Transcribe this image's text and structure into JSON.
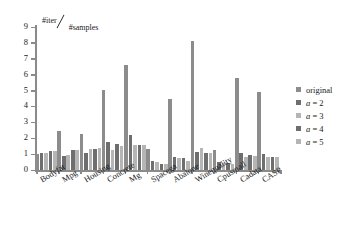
{
  "chart_data": {
    "type": "bar",
    "title_numerator": "#iter",
    "title_denominator": "#samples",
    "xlabel": "",
    "ylabel": "",
    "ylim": [
      0,
      9
    ],
    "yticks": [
      0,
      1,
      2,
      3,
      4,
      5,
      6,
      7,
      8,
      9
    ],
    "ytick_labels": [
      "0",
      "1",
      "2",
      "3",
      "4",
      "5",
      "6",
      "7",
      "8",
      "9"
    ],
    "grid": false,
    "legend_position": "right",
    "categories": [
      "Bodyfat",
      "Mpg",
      "Housing",
      "Concrete",
      "Mg",
      "Spacega",
      "Abalone",
      "Winequality",
      "Cpusmall",
      "Cadata",
      "CASP"
    ],
    "series": [
      {
        "name": "original",
        "color": "#8c8c8c",
        "values": [
          1.0,
          2.45,
          2.25,
          5.05,
          6.6,
          1.3,
          4.5,
          8.1,
          1.25,
          5.8,
          4.9
        ]
      },
      {
        "name": "a = 2",
        "color": "#6e6e6e",
        "values": [
          1.05,
          0.9,
          1.1,
          1.75,
          2.2,
          0.55,
          0.8,
          1.15,
          0.5,
          1.1,
          1.0
        ]
      },
      {
        "name": "a = 3",
        "color": "#b5b5b5",
        "values": [
          1.1,
          0.95,
          1.3,
          1.25,
          1.6,
          0.5,
          0.75,
          1.4,
          0.42,
          0.85,
          0.8
        ]
      },
      {
        "name": "a = 4",
        "color": "#6e6e6e",
        "values": [
          1.2,
          1.25,
          1.35,
          1.65,
          1.6,
          0.35,
          0.75,
          1.1,
          0.42,
          0.95,
          0.85
        ]
      },
      {
        "name": "a = 5",
        "color": "#b5b5b5",
        "values": [
          1.2,
          1.25,
          1.4,
          1.5,
          1.6,
          0.35,
          0.55,
          1.05,
          0.4,
          0.9,
          0.82
        ]
      }
    ]
  },
  "legend": {
    "entries": [
      {
        "label": "original",
        "color": "#8c8c8c"
      },
      {
        "label": "a = 2",
        "color": "#6e6e6e"
      },
      {
        "label": "a = 3",
        "color": "#b5b5b5"
      },
      {
        "label": "a = 4",
        "color": "#6e6e6e"
      },
      {
        "label": "a = 5",
        "color": "#b5b5b5"
      }
    ]
  },
  "axis": {
    "axis_color": "#8a8a8a"
  }
}
